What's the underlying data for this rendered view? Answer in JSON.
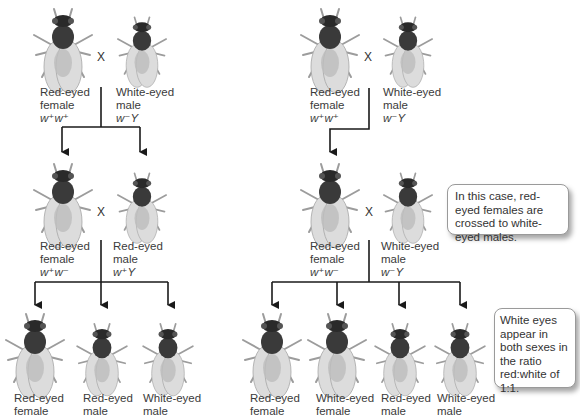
{
  "left_cross": {
    "parents": {
      "female": {
        "phenotype_line1": "Red-eyed",
        "phenotype_line2": "female",
        "genotype": "w⁺w⁺"
      },
      "male": {
        "phenotype_line1": "White-eyed",
        "phenotype_line2": "male",
        "genotype": "w⁻Y"
      },
      "cross_symbol": "X"
    },
    "f1": {
      "female": {
        "phenotype_line1": "Red-eyed",
        "phenotype_line2": "female",
        "genotype": "w⁺w⁻"
      },
      "male": {
        "phenotype_line1": "Red-eyed",
        "phenotype_line2": "male",
        "genotype": "w⁺Y"
      },
      "cross_symbol": "X"
    },
    "f2": [
      {
        "line1": "Red-eyed",
        "line2": "female"
      },
      {
        "line1": "Red-eyed",
        "line2": "male"
      },
      {
        "line1": "White-eyed",
        "line2": "male"
      }
    ]
  },
  "right_cross": {
    "parents": {
      "female": {
        "phenotype_line1": "Red-eyed",
        "phenotype_line2": "female",
        "genotype": "w⁺w⁺"
      },
      "male": {
        "phenotype_line1": "White-eyed",
        "phenotype_line2": "male",
        "genotype": "w⁻Y"
      },
      "cross_symbol": "X"
    },
    "backcross": {
      "female": {
        "phenotype_line1": "Red-eyed",
        "phenotype_line2": "female",
        "genotype": "w⁺w⁻"
      },
      "male": {
        "phenotype_line1": "White-eyed",
        "phenotype_line2": "male",
        "genotype": "w⁻Y"
      },
      "cross_symbol": "X"
    },
    "offspring": [
      {
        "line1": "Red-eyed",
        "line2": "female"
      },
      {
        "line1": "White-eyed",
        "line2": "female"
      },
      {
        "line1": "Red-eyed",
        "line2": "male"
      },
      {
        "line1": "White-eyed",
        "line2": "male"
      }
    ]
  },
  "callouts": {
    "case_note": "In this case, red-eyed females are crossed to white-eyed males.",
    "ratio_note": "White eyes appear in both sexes in the ratio red:white of 1:1."
  },
  "colors": {
    "line": "#1a1a1a",
    "fly_body_dark": "#2b2b2b",
    "fly_wing": "#d9d9d9",
    "callout_border": "#9a9a9a"
  }
}
